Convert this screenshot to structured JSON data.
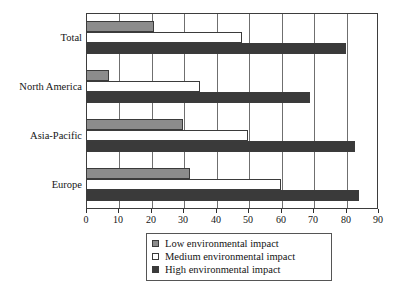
{
  "chart_data": {
    "type": "bar",
    "orientation": "horizontal",
    "title": "",
    "xlabel": "",
    "ylabel": "",
    "xlim": [
      0,
      90
    ],
    "xticks": [
      0,
      10,
      20,
      30,
      40,
      50,
      60,
      70,
      80,
      90
    ],
    "grid": true,
    "grid_axis": "x",
    "legend_position": "bottom-center",
    "categories": [
      "Total",
      "North America",
      "Asia-Pacific",
      "Europe"
    ],
    "series": [
      {
        "name": "Low environmental impact",
        "color": "#8c8c8c",
        "values": [
          21,
          7,
          30,
          32
        ]
      },
      {
        "name": "Medium environmental impact",
        "color": "#ffffff",
        "values": [
          48,
          35,
          50,
          60
        ]
      },
      {
        "name": "High environmental impact",
        "color": "#3a3a3a",
        "values": [
          80,
          69,
          83,
          84
        ]
      }
    ]
  },
  "legend": {
    "items": [
      {
        "label": "Low environmental impact",
        "swatch": "low"
      },
      {
        "label": "Medium environmental impact",
        "swatch": "medium"
      },
      {
        "label": "High environmental impact",
        "swatch": "high"
      }
    ]
  },
  "axis": {
    "tick_labels": [
      "0",
      "10",
      "20",
      "30",
      "40",
      "50",
      "60",
      "70",
      "80",
      "90"
    ]
  }
}
